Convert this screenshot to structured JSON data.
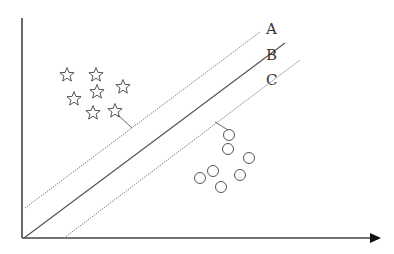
{
  "diagram": {
    "type": "svm-hyperplane-margin",
    "colors": {
      "stroke": "#555555",
      "axis": "#444444",
      "margin": "#888888"
    },
    "lines": [
      {
        "label": "A",
        "style": "dotted",
        "x1": 25,
        "y1": 208,
        "x2": 260,
        "y2": 32,
        "label_x": 266,
        "label_y": 34
      },
      {
        "label": "B",
        "style": "solid",
        "x1": 24,
        "y1": 238,
        "x2": 285,
        "y2": 43,
        "label_x": 266,
        "label_y": 60
      },
      {
        "label": "C",
        "style": "dotted",
        "x1": 64,
        "y1": 238,
        "x2": 300,
        "y2": 60,
        "label_x": 266,
        "label_y": 85
      }
    ],
    "class_stars": [
      {
        "x": 67,
        "y": 75
      },
      {
        "x": 96,
        "y": 75
      },
      {
        "x": 123,
        "y": 87
      },
      {
        "x": 74,
        "y": 99
      },
      {
        "x": 97,
        "y": 92
      },
      {
        "x": 93,
        "y": 113
      },
      {
        "x": 115,
        "y": 111
      }
    ],
    "class_circles": [
      {
        "x": 229,
        "y": 135
      },
      {
        "x": 228,
        "y": 149
      },
      {
        "x": 249,
        "y": 158
      },
      {
        "x": 213,
        "y": 171
      },
      {
        "x": 240,
        "y": 175
      },
      {
        "x": 200,
        "y": 178
      },
      {
        "x": 221,
        "y": 187
      }
    ],
    "support_connectors": [
      {
        "x1": 118,
        "y1": 115,
        "x2": 132,
        "y2": 128
      },
      {
        "x1": 215,
        "y1": 122,
        "x2": 228,
        "y2": 130
      }
    ],
    "axes": {
      "y_axis": {
        "x": 22,
        "y1": 18,
        "y2": 238
      },
      "x_axis": {
        "y": 238,
        "x1": 22,
        "x2": 372,
        "arrow_tip": 381
      }
    }
  }
}
